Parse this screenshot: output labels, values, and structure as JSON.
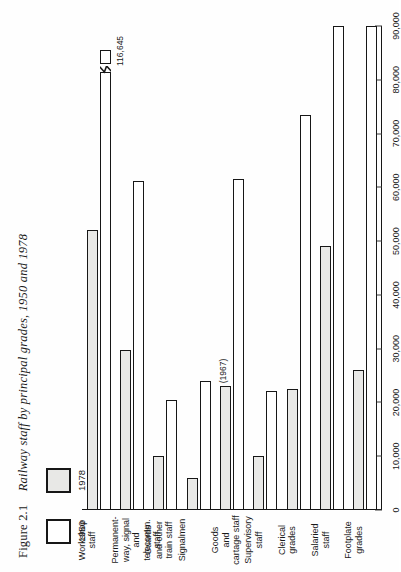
{
  "figure": {
    "number": "Figure 2.1",
    "caption": "Railway staff by principal grades, 1950 and 1978"
  },
  "legend": {
    "items": [
      {
        "label": "1950",
        "swatch": "white"
      },
      {
        "label": "1978",
        "swatch": "shaded"
      }
    ]
  },
  "axis": {
    "ticks": [
      "0",
      "10,000",
      "20,000",
      "30,000",
      "40,000",
      "50,000",
      "60,000",
      "70,000",
      "80,000",
      "90,000"
    ],
    "tick_values": [
      0,
      10000,
      20000,
      30000,
      40000,
      50000,
      60000,
      70000,
      80000,
      90000
    ]
  },
  "annotations": {
    "workshop_1950_value": "116,645",
    "goods_1978_note": "(1967)"
  },
  "chart_data": {
    "type": "bar",
    "orientation": "horizontal",
    "title": "Railway staff by principal grades, 1950 and 1978",
    "xlabel": "",
    "ylabel": "",
    "xlim": [
      0,
      90000
    ],
    "grid": false,
    "legend_position": "top-left",
    "axis_break": true,
    "categories": [
      "Footplate grades",
      "Salaried staff",
      "Clerical grades",
      "Supervisory staff",
      "Goods and cartage staff",
      "Signalmen",
      "Guards and other train staff",
      "Permanent-way, signal and telecomm. staff",
      "Workshop staff"
    ],
    "category_labels": [
      "Footplate\ngrades",
      "Salaried\nstaff",
      "Clerical\ngrades",
      "Supervisory\nstaff",
      "Goods\nand\ncartage staff",
      "Signalmen",
      "Guards\nand other\ntrain staff",
      "Permanent-\nway, signal\nand telecomm.\nstaff",
      "Workshop staff"
    ],
    "series": [
      {
        "name": "1950",
        "values": [
          95400,
          96600,
          73500,
          22200,
          61500,
          24000,
          20400,
          61200,
          116645
        ]
      },
      {
        "name": "1978",
        "values": [
          26000,
          49000,
          22500,
          10000,
          23000,
          6000,
          10000,
          29700,
          52000
        ]
      }
    ],
    "notes": [
      "Workshop staff 1950 bar is drawn with an axis break; its true value is 116,645.",
      "Goods and cartage staff 1978 bar is labelled (1967)."
    ]
  },
  "colors": {
    "ink": "#171717",
    "shaded_fill": "#e9e9e7",
    "plain_fill": "#ffffff",
    "page": "#fefefe"
  }
}
